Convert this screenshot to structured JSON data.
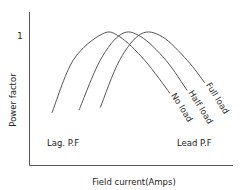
{
  "chart_data": {
    "type": "line",
    "title": "",
    "xlabel": "Field current(Amps)",
    "ylabel": "Power factor",
    "y_ticks": [
      {
        "value": 1,
        "label": "1"
      }
    ],
    "xlim": [
      0,
      10
    ],
    "ylim": [
      0,
      1.2
    ],
    "grid": false,
    "region_labels": {
      "left": "Lag. P.F",
      "right": "Lead P.F"
    },
    "series": [
      {
        "name": "No load",
        "x": [
          0.9,
          2.0,
          3.5,
          4.4,
          5.7,
          7.0
        ],
        "y": [
          0.4,
          0.8,
          1.0,
          0.98,
          0.8,
          0.55
        ]
      },
      {
        "name": "Half load",
        "x": [
          2.3,
          3.4,
          4.5,
          5.5,
          6.8,
          7.9
        ],
        "y": [
          0.42,
          0.8,
          1.0,
          0.98,
          0.8,
          0.57
        ]
      },
      {
        "name": "Full load",
        "x": [
          3.4,
          4.4,
          5.5,
          6.6,
          7.9,
          8.8
        ],
        "y": [
          0.44,
          0.8,
          1.0,
          0.98,
          0.8,
          0.63
        ]
      }
    ]
  }
}
